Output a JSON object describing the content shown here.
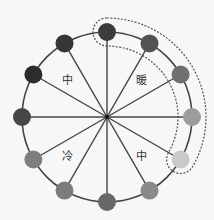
{
  "diagram": {
    "title": "",
    "center": [
      107,
      117
    ],
    "radius": 85,
    "dot_radius": 9,
    "wheel_stroke": "#444444",
    "spoke_stroke": "#444444",
    "dashed_region_stroke": "#555555",
    "nodes": [
      {
        "angle": 0,
        "color": "#3c3c3c"
      },
      {
        "angle": 30,
        "color": "#525252"
      },
      {
        "angle": 60,
        "color": "#707070"
      },
      {
        "angle": 90,
        "color": "#9c9c9c"
      },
      {
        "angle": 120,
        "color": "#c9c9c9"
      },
      {
        "angle": 150,
        "color": "#8a8a8a"
      },
      {
        "angle": 180,
        "color": "#686868"
      },
      {
        "angle": 210,
        "color": "#7c7c7c"
      },
      {
        "angle": 240,
        "color": "#7e7e7e"
      },
      {
        "angle": 270,
        "color": "#464646"
      },
      {
        "angle": 300,
        "color": "#2c2c2c"
      },
      {
        "angle": 330,
        "color": "#363636"
      }
    ],
    "labels": [
      {
        "id": "top-left",
        "text": "中",
        "x": 67,
        "y": 81
      },
      {
        "id": "top-right",
        "text": "暖",
        "x": 141,
        "y": 81
      },
      {
        "id": "bottom-left",
        "text": "冷",
        "x": 67,
        "y": 157
      },
      {
        "id": "bottom-right",
        "text": "中",
        "x": 141,
        "y": 157
      }
    ],
    "highlight": {
      "description": "dashed outline around warm arc",
      "from_angle": 0,
      "to_angle": 120
    }
  }
}
